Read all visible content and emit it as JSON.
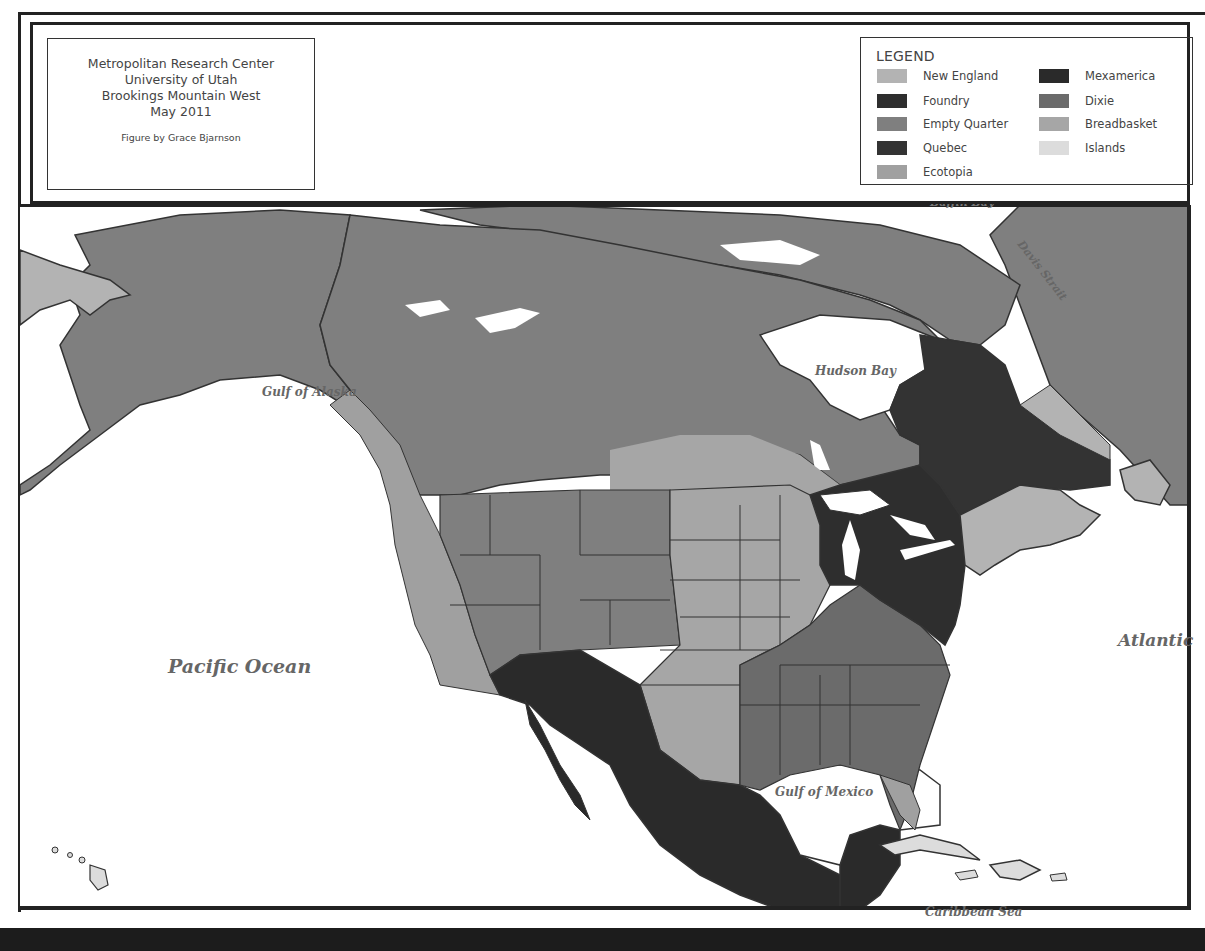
{
  "credit": {
    "lines": [
      "Metropolitan Research Center",
      "University of Utah",
      "Brookings Mountain West",
      "May 2011"
    ],
    "figure_by": "Figure by Grace Bjarnson"
  },
  "legend": {
    "title": "LEGEND",
    "items": [
      {
        "label": "New England",
        "color": "#b3b3b3"
      },
      {
        "label": "Foundry",
        "color": "#2e2e2e"
      },
      {
        "label": "Empty Quarter",
        "color": "#7f7f7f"
      },
      {
        "label": "Quebec",
        "color": "#333333"
      },
      {
        "label": "Ecotopia",
        "color": "#a0a0a0"
      },
      {
        "label": "Mexamerica",
        "color": "#2a2a2a"
      },
      {
        "label": "Dixie",
        "color": "#6b6b6b"
      },
      {
        "label": "Breadbasket",
        "color": "#a6a6a6"
      },
      {
        "label": "Islands",
        "color": "#dcdcdc"
      }
    ]
  },
  "map_labels": {
    "baffin_bay": "Baffin Bay",
    "davis_strait": "Davis Strait",
    "hudson_bay": "Hudson Bay",
    "gulf_of_alaska": "Gulf of Alaska",
    "pacific_ocean": "Pacific Ocean",
    "atlantic": "Atlantic",
    "gulf_of_mexico": "Gulf of Mexico",
    "caribbean_sea": "Caribbean Sea"
  },
  "colors": {
    "empty_quarter": "#7f7f7f",
    "foundry": "#2e2e2e",
    "mexamerica": "#2a2a2a",
    "dixie": "#6b6b6b",
    "breadbasket": "#a6a6a6",
    "ecotopia": "#a0a0a0",
    "new_england": "#b3b3b3",
    "islands": "#dcdcdc",
    "water": "#ffffff",
    "border": "#333333"
  }
}
